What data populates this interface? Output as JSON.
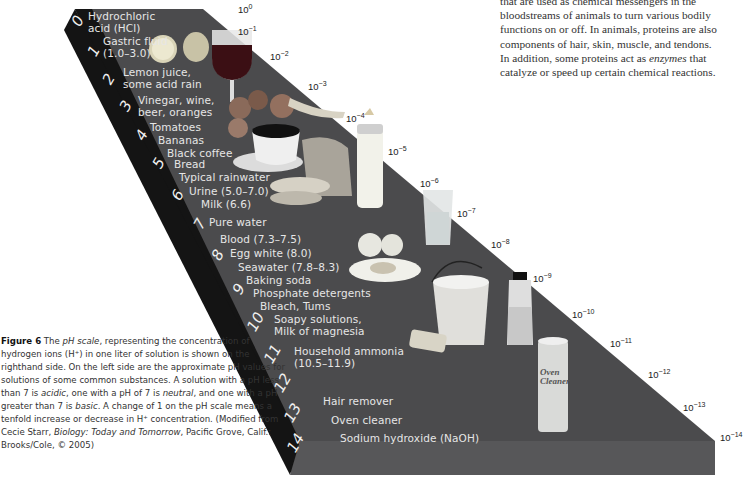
{
  "body_text": {
    "lines": [
      "that are used as chemical messengers in the",
      "bloodstreams of animals to turn various bodily",
      "functions on or off. In animals, proteins are also",
      "components of hair, skin, muscle, and tendons.",
      "In addition, some proteins act as ",
      "enzymes",
      " that",
      "catalyze or speed up certain chemical reactions."
    ]
  },
  "figure": {
    "ph_numbers": [
      "0",
      "1",
      "2",
      "3",
      "4",
      "5",
      "6",
      "7",
      "8",
      "9",
      "10",
      "11",
      "12",
      "13",
      "14"
    ],
    "substances": [
      "Hydrochloric\nacid (HCl)",
      "Gastric fluid\n(1.0–3.0)",
      "Lemon juice,\nsome acid rain",
      "Vinegar, wine,\nbeer, oranges",
      "Tomatoes",
      "Bananas",
      "Black coffee",
      "Bread",
      "Typical rainwater",
      "Urine (5.0–7.0)",
      "Milk (6.6)",
      "Pure water",
      "Blood (7.3–7.5)",
      "Egg white (8.0)",
      "Seawater (7.8–8.3)",
      "Baking soda",
      "Phosphate detergents",
      "Bleach, Tums",
      "Soapy solutions,\nMilk of magnesia",
      "Household ammonia\n(10.5–11.9)",
      "Hair remover",
      "Oven cleaner",
      "Sodium hydroxide (NaOH)"
    ],
    "concentration_base": "10",
    "concentration_exponents": [
      "0",
      "−1",
      "−2",
      "−3",
      "−4",
      "−5",
      "−6",
      "−7",
      "−8",
      "−9",
      "−10",
      "−11",
      "−12",
      "−13",
      "−14"
    ],
    "props": [
      "lemon-and-lime",
      "wine-glass",
      "tomatoes-and-bananas",
      "coffee-cup",
      "bread",
      "baby-bottle-milk",
      "glass-of-water",
      "eggs",
      "bucket-and-sponge",
      "bleach-bottle",
      "oven-cleaner-can"
    ],
    "oven_cleaner_label": "Oven\nCleaner"
  },
  "caption": {
    "label": "Figure 6",
    "parts": [
      {
        "t": " The ",
        "i": false
      },
      {
        "t": "pH scale",
        "i": true
      },
      {
        "t": ", representing the concentration of hydrogen ions (H⁺) in one liter of solution is shown on the righthand side. On the left side are the approximate pH values for solutions of some common substances. A solution with a pH less than 7 is ",
        "i": false
      },
      {
        "t": "acidic",
        "i": true
      },
      {
        "t": ", one with a pH of 7 is ",
        "i": false
      },
      {
        "t": "neutral",
        "i": true
      },
      {
        "t": ", and one with a pH greater than 7 is ",
        "i": false
      },
      {
        "t": "basic",
        "i": true
      },
      {
        "t": ". A change of 1 on the pH scale means a tenfold increase or decrease in H⁺ concentration. (Modified from Cecie Starr, ",
        "i": false
      },
      {
        "t": "Biology: Today and Tomorrow",
        "i": true
      },
      {
        "t": ", Pacific Grove, Calif.: Brooks/Cole, © 2005)",
        "i": false
      }
    ]
  },
  "colors": {
    "slab_top": "#4b4b4d",
    "slab_side": "#151515",
    "slab_front": "#565658",
    "label_text": "#e6e6e6"
  }
}
